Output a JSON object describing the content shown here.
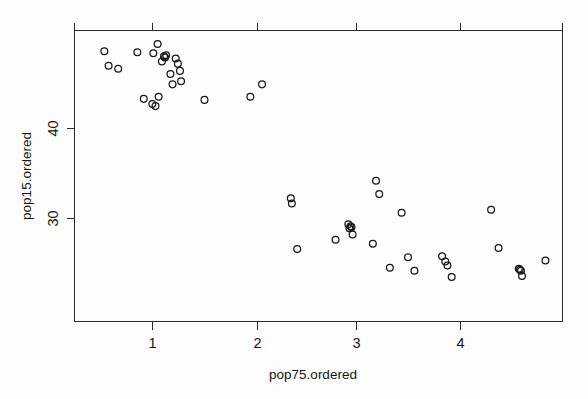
{
  "chart_data": {
    "type": "scatter",
    "title": "",
    "xlabel": "pop75.ordered",
    "ylabel": "pop15.ordered",
    "xlim": [
      0.28,
      4.86
    ],
    "ylim": [
      20.4,
      48.5
    ],
    "xticks": [
      1,
      2,
      3,
      4
    ],
    "xtick_labels": [
      "1",
      "2",
      "3",
      "4"
    ],
    "yticks": [
      30,
      40
    ],
    "ytick_labels": [
      "30",
      "40"
    ],
    "grid": false,
    "legend": null,
    "marker": "open-circle",
    "marker_radius_px": 3.4,
    "n_points": 50,
    "x": [
      0.56,
      0.87,
      0.6,
      0.69,
      1.06,
      1.02,
      1.14,
      1.12,
      1.13,
      1.23,
      1.1,
      1.25,
      1.27,
      1.18,
      1.2,
      1.28,
      1.07,
      0.93,
      1.01,
      1.04,
      1.5,
      1.93,
      2.04,
      2.32,
      2.37,
      2.31,
      2.85,
      2.87,
      2.86,
      2.88,
      2.89,
      2.73,
      3.08,
      3.11,
      3.14,
      3.35,
      3.41,
      3.24,
      3.47,
      3.73,
      3.76,
      3.78,
      3.82,
      4.19,
      4.45,
      4.46,
      4.47,
      4.48,
      4.7,
      4.26
    ],
    "y": [
      46.5,
      46.4,
      45.1,
      44.8,
      47.2,
      46.3,
      46.1,
      46.0,
      45.9,
      45.8,
      45.5,
      45.3,
      44.6,
      44.3,
      43.3,
      43.6,
      42.1,
      41.9,
      41.4,
      41.2,
      41.8,
      42.1,
      43.3,
      31.8,
      27.4,
      32.3,
      29.8,
      29.6,
      29.4,
      29.5,
      28.8,
      28.3,
      27.9,
      34.0,
      32.7,
      30.9,
      26.6,
      25.6,
      25.3,
      26.7,
      26.2,
      25.8,
      24.7,
      31.2,
      25.5,
      25.4,
      25.3,
      24.8,
      26.3,
      27.5
    ]
  },
  "axes": {
    "x_title": "pop75.ordered",
    "y_title": "pop15.ordered",
    "x_tick_labels": [
      "1",
      "2",
      "3",
      "4"
    ],
    "y_tick_labels": [
      "40",
      "30"
    ]
  },
  "style": {
    "axis_color": "#2b2b2b",
    "marker_color": "#17171a",
    "background": "#fdfdfc"
  }
}
